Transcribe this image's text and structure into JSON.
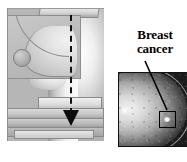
{
  "figure": {
    "title_visible": false,
    "background_color": "#ffffff",
    "width": 187,
    "height": 162
  },
  "diagram": {
    "name": "mammography-compression-diagram",
    "description_visible": false,
    "panel_fill": "#b6b6b6",
    "beam_axis": {
      "style": "dashed",
      "color": "#101010",
      "direction": "vertical-downward"
    },
    "arrow": {
      "color": "#0c0c0c",
      "direction": "down"
    },
    "parts": {
      "top_paddle": "compression-paddle",
      "lower_plates": "detector-plates",
      "breast_profile": "breast-side-profile",
      "inset": "internal-anatomy-inset",
      "lesion_marker": "lesion-circle"
    }
  },
  "mammogram": {
    "name": "mammogram-image",
    "modality_visible": false,
    "roi": {
      "shape": "square",
      "border_color": "#000000",
      "marks": "breast-cancer-lesion"
    }
  },
  "callout": {
    "label_line_1": "Breast",
    "label_line_2": "cancer",
    "label_full": "Breast cancer",
    "leader_color": "#000000"
  }
}
